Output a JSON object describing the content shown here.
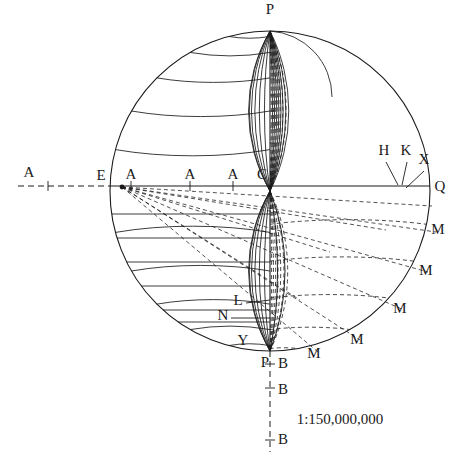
{
  "figure": {
    "kind": "globe-projection-construction-diagram",
    "scale_text": "1:150,000,000",
    "background_color": "#ffffff",
    "ink_color": "#1a1a1a"
  },
  "geometry": {
    "circle": {
      "cx": 270,
      "cy": 191,
      "r": 160
    },
    "equator_y": 186,
    "axis_x": 270,
    "left_axis_end_x": 18,
    "bottom_axis_end_y": 452
  },
  "labels": {
    "pole_top": "P",
    "pole_bottom": "P",
    "equator_right": "Q",
    "equator_left_outer": "A",
    "equator_E": "E",
    "equator_A1": "A",
    "equator_A2": "A",
    "equator_A3": "A",
    "equator_C": "C",
    "ray_H": "H",
    "ray_K": "K",
    "ray_X": "X",
    "lower_left_L": "L",
    "lower_left_N": "N",
    "lower_left_Y": "Y",
    "rim_M1": "M",
    "rim_M2": "M",
    "rim_M3": "M",
    "rim_M4": "M",
    "rim_M5": "M",
    "axis_B1": "B",
    "axis_B2": "B",
    "axis_B3": "B"
  },
  "label_positions": {
    "pole_top": {
      "x": 270,
      "y": 14
    },
    "pole_bottom": {
      "x": 265,
      "y": 367
    },
    "equator_right": {
      "x": 440,
      "y": 191
    },
    "equator_left_outer": {
      "x": 29,
      "y": 177
    },
    "equator_E": {
      "x": 101,
      "y": 180
    },
    "equator_A1": {
      "x": 131,
      "y": 179
    },
    "equator_A2": {
      "x": 190,
      "y": 179
    },
    "equator_A3": {
      "x": 233,
      "y": 179
    },
    "equator_C": {
      "x": 262,
      "y": 179
    },
    "ray_H": {
      "x": 384,
      "y": 155
    },
    "ray_K": {
      "x": 406,
      "y": 155
    },
    "ray_X": {
      "x": 424,
      "y": 164
    },
    "lower_left_L": {
      "x": 238,
      "y": 305
    },
    "lower_left_N": {
      "x": 223,
      "y": 320
    },
    "lower_left_Y": {
      "x": 243,
      "y": 345
    },
    "rim_M1": {
      "x": 438,
      "y": 234
    },
    "rim_M2": {
      "x": 426,
      "y": 275
    },
    "rim_M3": {
      "x": 400,
      "y": 313
    },
    "rim_M4": {
      "x": 357,
      "y": 344
    },
    "rim_M5": {
      "x": 314,
      "y": 358
    },
    "axis_B1": {
      "x": 283,
      "y": 368
    },
    "axis_B2": {
      "x": 283,
      "y": 394
    },
    "axis_B3": {
      "x": 283,
      "y": 444
    },
    "scale_text": {
      "x": 340,
      "y": 424
    }
  },
  "equator_ticks_x": [
    48,
    131,
    190,
    233
  ],
  "axis_ticks_y": [
    364,
    388,
    440
  ],
  "graticule": {
    "upper_left_parallels_deg": [
      15,
      30,
      45,
      60,
      75
    ],
    "upper_left_meridians_deg": [
      15,
      30,
      45,
      60,
      75,
      90
    ],
    "lower_left_parallels_deg": [
      15,
      30,
      45,
      60,
      75
    ],
    "lower_left_meridians_deg": [
      15,
      30,
      45,
      60,
      75,
      90
    ],
    "upper_right_meridians_deg": [
      10,
      20,
      30,
      40,
      50,
      60,
      70,
      80,
      90
    ],
    "lower_right_dashed_grid": true
  }
}
